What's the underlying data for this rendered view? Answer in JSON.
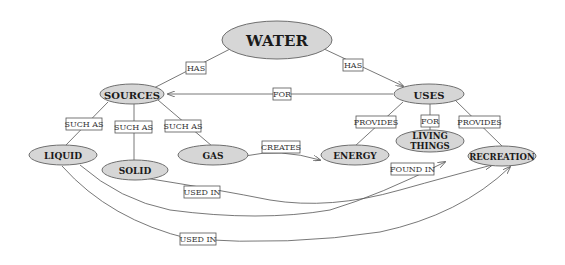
{
  "diagram": {
    "type": "concept-map",
    "colors": {
      "node_fill": "#d6d6d6",
      "node_stroke": "#6e6e6e",
      "edge": "#555555"
    },
    "nodes": {
      "water": "WATER",
      "sources": "SOURCES",
      "uses": "USES",
      "liquid": "LIQUID",
      "solid": "SOLID",
      "gas": "GAS",
      "energy": "ENERGY",
      "living_line1": "LIVING",
      "living_line2": "THINGS",
      "recreation": "RECREATION"
    },
    "edges": {
      "water_sources": "HAS",
      "water_uses": "HAS",
      "uses_sources": "FOR",
      "sources_liquid": "SUCH AS",
      "sources_solid": "SUCH AS",
      "sources_gas": "SUCH AS",
      "gas_energy": "CREATES",
      "uses_energy": "PROVIDES",
      "uses_living": "FOR",
      "uses_recreation": "PROVIDES",
      "solid_recreation": "USED IN",
      "liquid_living": "FOUND IN",
      "liquid_recreation": "USED IN"
    }
  }
}
